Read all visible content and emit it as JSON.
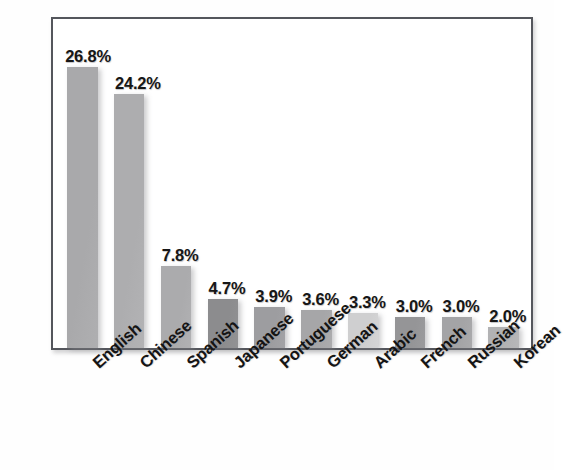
{
  "chart_data": {
    "type": "bar",
    "title": "",
    "subtitle": "",
    "xlabel": "",
    "ylabel": "",
    "ylim": [
      0,
      30
    ],
    "grid": false,
    "legend": false,
    "categories": [
      "English",
      "Chinese",
      "Spanish",
      "Japanese",
      "Portuguese",
      "German",
      "Arabic",
      "French",
      "Russian",
      "Korean"
    ],
    "values": [
      26.8,
      24.2,
      7.8,
      4.7,
      3.9,
      3.6,
      3.3,
      3.0,
      3.0,
      2.0
    ],
    "value_labels": [
      "26.8%",
      "24.2%",
      "7.8%",
      "4.7%",
      "3.9%",
      "3.6%",
      "3.3%",
      "3.0%",
      "3.0%",
      "2.0%"
    ],
    "bar_colors": [
      "#a9a9ab",
      "#adadaf",
      "#ababad",
      "#8c8c8e",
      "#9d9da0",
      "#a6a6a8",
      "#cfcfd0",
      "#959597",
      "#a4a4a6",
      "#b2b2b4"
    ]
  },
  "axis": {
    "frame_color": "#54565c",
    "background": "#ffffff"
  }
}
